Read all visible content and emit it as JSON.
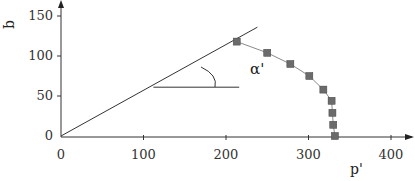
{
  "chart_data": {
    "type": "line",
    "title": "",
    "xlabel": "p'",
    "ylabel": "q",
    "xlim": [
      0,
      420
    ],
    "ylim": [
      0,
      160
    ],
    "x_ticks": [
      0,
      100,
      200,
      300,
      400
    ],
    "y_ticks": [
      0,
      50,
      100,
      150
    ],
    "grid": false,
    "legend": null,
    "series": [
      {
        "name": "stress path",
        "marker": "square",
        "color": "#6b6b6b",
        "x": [
          213,
          250,
          278,
          301,
          318,
          328,
          329,
          330,
          332
        ],
        "y": [
          118,
          104,
          90,
          75,
          58,
          44,
          29,
          14,
          0
        ]
      },
      {
        "name": "failure envelope",
        "marker": "none",
        "color": "#333333",
        "x": [
          0,
          238
        ],
        "y": [
          0,
          136
        ]
      },
      {
        "name": "horizontal reference",
        "marker": "none",
        "color": "#333333",
        "x": [
          112,
          216
        ],
        "y": [
          61,
          61
        ]
      }
    ],
    "annotations": [
      {
        "text": "α'",
        "x": 235,
        "y": 88,
        "meaning": "envelope slope angle"
      }
    ]
  },
  "labels": {
    "xlabel": "p'",
    "ylabel": "q",
    "angle": "α'",
    "x_ticks": [
      "0",
      "100",
      "200",
      "300",
      "400"
    ],
    "y_ticks": [
      "0",
      "50",
      "100",
      "150"
    ]
  }
}
